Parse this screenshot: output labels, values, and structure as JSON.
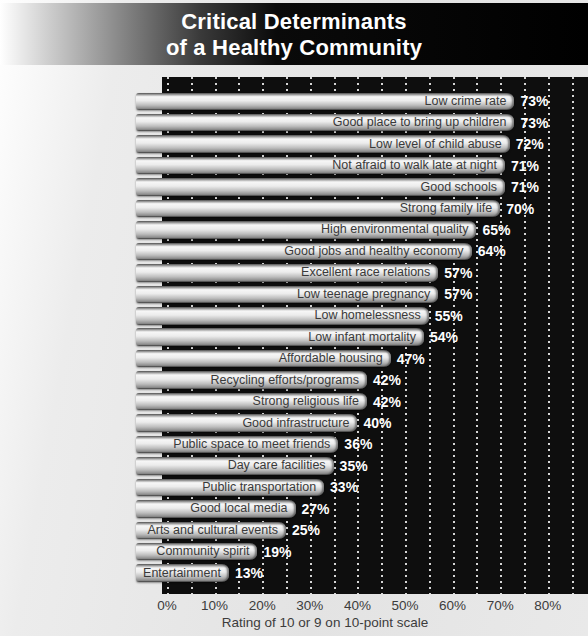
{
  "banner": {
    "title_line1": "Critical Determinants",
    "title_line2": "of a Healthy Community"
  },
  "chart_data": {
    "type": "bar",
    "orientation": "horizontal",
    "title": "Critical Determinants of a Healthy Community",
    "categories": [
      "Low crime rate",
      "Good place to bring up children",
      "Low level of child abuse",
      "Not afraid to walk late at night",
      "Good schools",
      "Strong family life",
      "High environmental quality",
      "Good jobs and healthy economy",
      "Excellent race relations",
      "Low teenage pregnancy",
      "Low homelessness",
      "Low infant mortality",
      "Affordable housing",
      "Recycling efforts/programs",
      "Strong religious life",
      "Good infrastructure",
      "Public space to meet friends",
      "Day care facilities",
      "Public transportation",
      "Good local media",
      "Arts and cultural events",
      "Community spirit",
      "Entertainment"
    ],
    "values": [
      73,
      73,
      72,
      71,
      71,
      70,
      65,
      64,
      57,
      57,
      55,
      54,
      47,
      42,
      42,
      40,
      36,
      35,
      33,
      27,
      25,
      19,
      13
    ],
    "value_suffix": "%",
    "xlabel": "Rating of 10 or 9 on 10-point scale",
    "x_ticks": [
      "0%",
      "10%",
      "20%",
      "30%",
      "40%",
      "50%",
      "60%",
      "70%",
      "80%"
    ],
    "xlim": [
      0,
      85
    ],
    "gridline_step_pct": 5,
    "grid": "dotted white vertical lines on black plot background",
    "legend": "none",
    "colors": {
      "plot_background": "#0e0e0e",
      "bar_highlight": "#f7f7f7",
      "bar_shadow": "#8a8a8a",
      "bar_label_text": "#3a3a3a",
      "value_text": "#ffffff",
      "gridline": "#ebebeb",
      "banner_text": "#ffffff",
      "banner_background_left": "#ffffff",
      "banner_background_right": "#000000",
      "page_background": "#e6e6e6",
      "axis_text": "#3c3c3c"
    }
  }
}
